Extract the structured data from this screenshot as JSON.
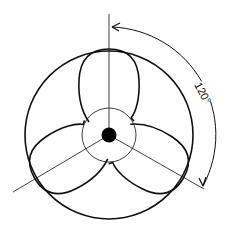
{
  "diagram": {
    "blade_count": 3,
    "angle_label": "120°",
    "colors": {
      "stroke": "#111111",
      "background": "#ffffff",
      "hub_fill": "#000000"
    }
  }
}
